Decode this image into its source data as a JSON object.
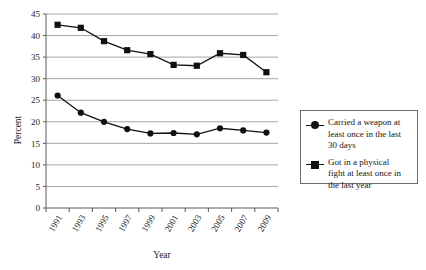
{
  "chart_data": {
    "type": "line",
    "title": "",
    "xlabel": "Year",
    "ylabel": "Percent",
    "x": [
      1991,
      1993,
      1995,
      1997,
      1999,
      2001,
      2003,
      2005,
      2007,
      2009
    ],
    "categories": [
      "1991",
      "1993",
      "1995",
      "1997",
      "1999",
      "2001",
      "2003",
      "2005",
      "2007",
      "2009"
    ],
    "ylim": [
      0,
      45
    ],
    "yticks": [
      0,
      5,
      10,
      15,
      20,
      25,
      30,
      35,
      40,
      45
    ],
    "ytick_labels": [
      "0",
      "5",
      "10",
      "15",
      "20",
      "25",
      "30",
      "35",
      "40",
      "45"
    ],
    "grid": true,
    "legend_position": "right",
    "series": [
      {
        "name": "Carried a weapon at least once in the last 30 days",
        "marker": "circle",
        "color": "#111111",
        "values": [
          26.1,
          22.1,
          20.0,
          18.3,
          17.3,
          17.4,
          17.1,
          18.5,
          18.0,
          17.5
        ]
      },
      {
        "name": "Got in a physical fight at least once in the last year",
        "marker": "square",
        "color": "#111111",
        "values": [
          42.5,
          41.8,
          38.7,
          36.6,
          35.7,
          33.2,
          33.0,
          35.9,
          35.5,
          31.5
        ]
      }
    ]
  },
  "legend": {
    "items": [
      {
        "marker": "circle",
        "label": "Carried a weapon at\nleast once in the last\n30 days"
      },
      {
        "marker": "square",
        "label": "Got in a physical\nfight at least once in\nthe last year"
      }
    ]
  },
  "axes": {
    "y_title": "Percent",
    "x_title": "Year"
  }
}
